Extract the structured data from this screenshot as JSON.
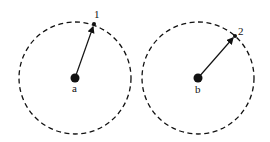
{
  "diagram": {
    "colors": {
      "stroke": "#111111",
      "background": "#ffffff"
    },
    "panels": [
      {
        "center_label": "a",
        "point_label": "1",
        "center": [
          75,
          78
        ],
        "radius": 56,
        "point": [
          94,
          24
        ]
      },
      {
        "center_label": "b",
        "point_label": "2",
        "center": [
          198,
          78
        ],
        "radius": 56,
        "point": [
          235,
          36
        ]
      }
    ]
  }
}
